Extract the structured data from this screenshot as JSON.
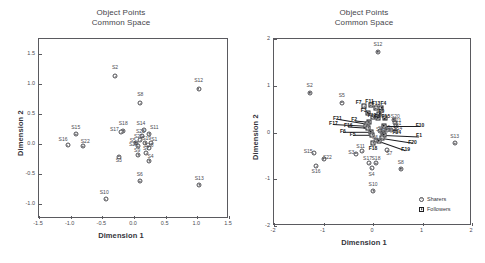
{
  "panels": [
    {
      "title_line1": "Object Points",
      "title_line2": "Common Space",
      "xlabel": "Dimension 1",
      "ylabel": "Dimension 2",
      "xticks": [
        "-1.5",
        "-1.0",
        "-0.5",
        "0.0",
        "0.5",
        "1.0",
        "1.5"
      ],
      "yticks": [
        "1.5",
        "1.0",
        "0.5",
        "0.0",
        "-0.5",
        "-1.0"
      ]
    },
    {
      "title_line1": "Object Points",
      "title_line2": "Common Space",
      "xlabel": "Dimension 1",
      "ylabel": "Dimension 2",
      "xticks": [
        "-2",
        "-1",
        "0",
        "1",
        "2"
      ],
      "yticks": [
        "2",
        "1",
        "0",
        "-1",
        "-2"
      ],
      "legend": [
        {
          "label": "Sharers",
          "marker": "circle-icon"
        },
        {
          "label": "Followers",
          "marker": "square-icon"
        }
      ]
    }
  ],
  "chart_data": [
    {
      "type": "scatter",
      "title": "Object Points Common Space",
      "xlabel": "Dimension 1",
      "ylabel": "Dimension 2",
      "xlim": [
        -1.5,
        1.5
      ],
      "ylim": [
        -1.25,
        1.75
      ],
      "xticks": [
        -1.5,
        -1.0,
        -0.5,
        0.0,
        0.5,
        1.0,
        1.5
      ],
      "yticks": [
        1.5,
        1.0,
        0.5,
        0.0,
        -0.5,
        -1.0
      ],
      "grid": false,
      "legend": "none",
      "series": [
        {
          "name": "Sharers",
          "marker": "circle",
          "points": [
            {
              "label": "S2",
              "x": -0.3,
              "y": 1.13,
              "lx": -0.3,
              "ly": 1.26
            },
            {
              "label": "S12",
              "x": 1.02,
              "y": 0.92,
              "lx": 1.02,
              "ly": 1.05
            },
            {
              "label": "S8",
              "x": 0.1,
              "y": 0.68,
              "lx": 0.1,
              "ly": 0.81
            },
            {
              "label": "S18",
              "x": -0.17,
              "y": 0.22,
              "lx": -0.17,
              "ly": 0.33
            },
            {
              "label": "S17",
              "x": -0.2,
              "y": 0.2,
              "lx": -0.31,
              "ly": 0.23
            },
            {
              "label": "S14",
              "x": 0.15,
              "y": 0.23,
              "lx": 0.11,
              "ly": 0.33
            },
            {
              "label": "S11",
              "x": 0.24,
              "y": 0.17,
              "lx": 0.32,
              "ly": 0.26
            },
            {
              "label": "S23",
              "x": 0.13,
              "y": 0.13,
              "lx": 0.1,
              "ly": 0.2
            },
            {
              "label": "S21",
              "x": 0.1,
              "y": 0.06,
              "lx": 0.07,
              "ly": 0.12
            },
            {
              "label": "S19",
              "x": 0.18,
              "y": 0.02,
              "lx": 0.2,
              "ly": 0.08
            },
            {
              "label": "S1",
              "x": 0.27,
              "y": 0.01,
              "lx": 0.32,
              "ly": 0.07
            },
            {
              "label": "S5",
              "x": 0.03,
              "y": 0.02,
              "lx": -0.02,
              "ly": 0.05
            },
            {
              "label": "S24",
              "x": 0.06,
              "y": -0.04,
              "lx": -0.01,
              "ly": -0.02
            },
            {
              "label": "S20",
              "x": 0.23,
              "y": -0.06,
              "lx": 0.24,
              "ly": -0.03
            },
            {
              "label": "S9",
              "x": 0.07,
              "y": -0.18,
              "lx": 0.05,
              "ly": -0.12
            },
            {
              "label": "S7",
              "x": 0.19,
              "y": -0.15,
              "lx": 0.19,
              "ly": -0.09
            },
            {
              "label": "S3",
              "x": -0.24,
              "y": -0.21,
              "lx": -0.24,
              "ly": -0.28
            },
            {
              "label": "S4",
              "x": 0.24,
              "y": -0.28,
              "lx": 0.26,
              "ly": -0.22
            },
            {
              "label": "S15",
              "x": -0.92,
              "y": 0.16,
              "lx": -0.92,
              "ly": 0.27
            },
            {
              "label": "S16",
              "x": -1.05,
              "y": -0.02,
              "lx": -1.12,
              "ly": 0.06
            },
            {
              "label": "S22",
              "x": -0.81,
              "y": -0.04,
              "lx": -0.77,
              "ly": 0.04
            },
            {
              "label": "S6",
              "x": 0.09,
              "y": -0.62,
              "lx": 0.09,
              "ly": -0.52
            },
            {
              "label": "S13",
              "x": 1.03,
              "y": -0.68,
              "lx": 1.03,
              "ly": -0.58
            },
            {
              "label": "S10",
              "x": -0.45,
              "y": -0.92,
              "lx": -0.47,
              "ly": -0.82
            }
          ]
        }
      ]
    },
    {
      "type": "scatter",
      "title": "Object Points Common Space",
      "xlabel": "Dimension 1",
      "ylabel": "Dimension 2",
      "xlim": [
        -2,
        2
      ],
      "ylim": [
        -2,
        2
      ],
      "xticks": [
        -2,
        -1,
        0,
        1,
        2
      ],
      "yticks": [
        2,
        1,
        0,
        -1,
        -2
      ],
      "grid": false,
      "legend": "bottom-right",
      "series": [
        {
          "name": "Sharers",
          "marker": "circle",
          "points": [
            {
              "label": "S12",
              "x": 0.1,
              "y": 1.73,
              "lx": 0.1,
              "ly": 1.88
            },
            {
              "label": "S2",
              "x": -1.28,
              "y": 0.85,
              "lx": -1.28,
              "ly": 0.99
            },
            {
              "label": "S5",
              "x": -0.63,
              "y": 0.64,
              "lx": -0.63,
              "ly": 0.78
            },
            {
              "label": "S13",
              "x": 1.65,
              "y": -0.23,
              "lx": 1.65,
              "ly": -0.09
            },
            {
              "label": "S15",
              "x": -1.2,
              "y": -0.44,
              "lx": -1.31,
              "ly": -0.41
            },
            {
              "label": "S22",
              "x": -1.0,
              "y": -0.56,
              "lx": -0.92,
              "ly": -0.54
            },
            {
              "label": "S16",
              "x": -1.15,
              "y": -0.72,
              "lx": -1.15,
              "ly": -0.85
            },
            {
              "label": "S3",
              "x": -0.35,
              "y": -0.45,
              "lx": -0.44,
              "ly": -0.43
            },
            {
              "label": "S11",
              "x": -0.22,
              "y": -0.4,
              "lx": -0.25,
              "ly": -0.32
            },
            {
              "label": "S17",
              "x": -0.08,
              "y": -0.66,
              "lx": -0.11,
              "ly": -0.56
            },
            {
              "label": "S18",
              "x": 0.06,
              "y": -0.66,
              "lx": 0.06,
              "ly": -0.56
            },
            {
              "label": "S4",
              "x": -0.03,
              "y": -0.77,
              "lx": -0.03,
              "ly": -0.9
            },
            {
              "label": "S7",
              "x": 0.29,
              "y": -0.38,
              "lx": 0.33,
              "ly": -0.46
            },
            {
              "label": "S8",
              "x": 0.56,
              "y": -0.78,
              "lx": 0.56,
              "ly": -0.65
            },
            {
              "label": "S10",
              "x": 0.0,
              "y": -1.25,
              "lx": 0.0,
              "ly": -1.12
            },
            {
              "label": "S20",
              "x": 0.42,
              "y": 0.27,
              "lx": 0.45,
              "ly": 0.33
            },
            {
              "label": "S21",
              "x": 0.44,
              "y": 0.2,
              "lx": 0.48,
              "ly": 0.25
            },
            {
              "label": "S1",
              "x": 0.47,
              "y": 0.14,
              "lx": 0.51,
              "ly": 0.18
            },
            {
              "label": "S14",
              "x": 0.46,
              "y": 0.04,
              "lx": 0.5,
              "ly": 0.07
            },
            {
              "label": "S23",
              "x": 0.36,
              "y": 0.05,
              "lx": 0.36,
              "ly": 0.08
            },
            {
              "label": "S19",
              "x": 0.28,
              "y": 0.06,
              "lx": 0.26,
              "ly": 0.09
            },
            {
              "label": "S24",
              "x": 0.21,
              "y": 0.05,
              "lx": 0.19,
              "ly": 0.08
            },
            {
              "label": "S9",
              "x": 0.14,
              "y": 0.03,
              "lx": 0.12,
              "ly": 0.06
            },
            {
              "label": "S6",
              "x": 0.06,
              "y": -0.15,
              "lx": 0.04,
              "ly": -0.12
            }
          ]
        },
        {
          "name": "Followers",
          "marker": "square",
          "points": [
            {
              "label": "F7",
              "x": -0.18,
              "y": 0.56,
              "lx": -0.29,
              "ly": 0.63
            },
            {
              "label": "F11",
              "x": -0.05,
              "y": 0.58,
              "lx": -0.07,
              "ly": 0.66
            },
            {
              "label": "F13",
              "x": 0.06,
              "y": 0.52,
              "lx": 0.06,
              "ly": 0.6
            },
            {
              "label": "F4",
              "x": 0.17,
              "y": 0.53,
              "lx": 0.21,
              "ly": 0.6
            },
            {
              "label": "F3",
              "x": -0.11,
              "y": 0.42,
              "lx": -0.19,
              "ly": 0.45
            },
            {
              "label": "F9",
              "x": 0.13,
              "y": 0.4,
              "lx": 0.17,
              "ly": 0.43
            },
            {
              "label": "F12",
              "x": 0.01,
              "y": 0.33,
              "lx": -0.02,
              "ly": 0.35
            },
            {
              "label": "F8",
              "x": 0.1,
              "y": 0.32,
              "lx": 0.09,
              "ly": 0.34
            },
            {
              "label": "F15",
              "x": 0.24,
              "y": 0.3,
              "lx": 0.26,
              "ly": 0.33
            },
            {
              "label": "F2",
              "x": -0.09,
              "y": 0.23,
              "lx": -0.38,
              "ly": 0.26
            },
            {
              "label": "F21",
              "x": -0.12,
              "y": 0.18,
              "lx": -0.72,
              "ly": 0.29
            },
            {
              "label": "F17",
              "x": -0.14,
              "y": 0.14,
              "lx": -0.8,
              "ly": 0.18
            },
            {
              "label": "F16",
              "x": -0.1,
              "y": 0.1,
              "lx": -0.5,
              "ly": 0.13
            },
            {
              "label": "F6",
              "x": -0.05,
              "y": 0.02,
              "lx": -0.61,
              "ly": 0.02
            },
            {
              "label": "F5",
              "x": -0.02,
              "y": -0.05,
              "lx": -0.41,
              "ly": -0.05
            },
            {
              "label": "F14",
              "x": 0.2,
              "y": 0.0,
              "lx": 0.48,
              "ly": 0.0
            },
            {
              "label": "F10",
              "x": 0.22,
              "y": 0.14,
              "lx": 0.95,
              "ly": 0.14
            },
            {
              "label": "F1",
              "x": 0.22,
              "y": -0.05,
              "lx": 0.93,
              "ly": -0.08
            },
            {
              "label": "F20",
              "x": 0.18,
              "y": -0.12,
              "lx": 0.8,
              "ly": -0.22
            },
            {
              "label": "F19",
              "x": 0.12,
              "y": -0.18,
              "lx": 0.66,
              "ly": -0.38
            },
            {
              "label": "F18",
              "x": 0.0,
              "y": -0.22,
              "lx": 0.0,
              "ly": -0.36
            }
          ]
        }
      ]
    }
  ]
}
